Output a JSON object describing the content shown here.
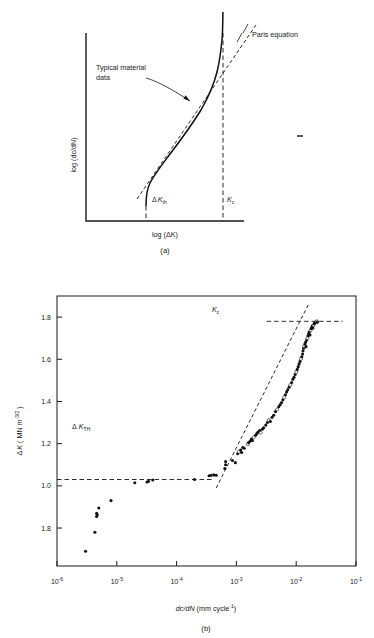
{
  "figure": {
    "panels": [
      {
        "id": "a",
        "caption": "(a)",
        "type": "schematic",
        "xlabel_parts": {
          "pre": "log (",
          "delta": "Δ",
          "k": "K",
          "post": ")"
        },
        "xlabel": "log (ΔK)",
        "ylabel": "log (dc/dN)",
        "annotations": [
          {
            "name": "paris-equation",
            "text": "Paris equation"
          },
          {
            "name": "typical-material-data",
            "line1": "Typical material",
            "line2": "data"
          },
          {
            "name": "delta-k-th",
            "delta": "Δ",
            "symbol": "K",
            "sub": "th"
          },
          {
            "name": "k-c",
            "symbol": "K",
            "sub": "c"
          }
        ]
      },
      {
        "id": "b",
        "caption": "(b)",
        "type": "scatter",
        "xlabel": "dc/dN  (mm cycle⁻¹)",
        "xlabel_parts": {
          "a": "d",
          "b": "c",
          "c": "/d",
          "d": "N",
          "e": "  (mm cycle",
          "sup": "-1",
          "f": ")"
        },
        "ylabel": "ΔK  (MN m⁻³ᐟ²)",
        "ylabel_parts": {
          "delta": "Δ",
          "k": "K",
          "open": "  ( MN m",
          "sup": "-3/2",
          "close": " )"
        },
        "annotations": [
          {
            "name": "delta-k-th-threshold",
            "delta": "Δ",
            "symbol": "K",
            "sub": "TH",
            "value": 1.03
          },
          {
            "name": "k-c-critical",
            "symbol": "K",
            "sub": "c",
            "value": 1.78
          }
        ]
      }
    ]
  },
  "chart_data": [
    {
      "panel": "a",
      "type": "line",
      "title": "",
      "xlabel": "log (ΔK)",
      "ylabel": "log (dc/dN)",
      "grid": false,
      "legend": null,
      "notes": "Schematic sigmoidal fatigue crack growth rate curve with three regimes; dashed asymptotes at threshold and fracture toughness, dashed Paris-law straight-line segment.",
      "series": [
        {
          "name": "Typical material data",
          "style": "solid-curve",
          "points_xy": [
            [
              0.3,
              0.05
            ],
            [
              0.303,
              0.11
            ],
            [
              0.312,
              0.17
            ],
            [
              0.33,
              0.228
            ],
            [
              0.36,
              0.285
            ],
            [
              0.4,
              0.34
            ],
            [
              0.45,
              0.4
            ],
            [
              0.51,
              0.47
            ],
            [
              0.57,
              0.545
            ],
            [
              0.625,
              0.62
            ],
            [
              0.672,
              0.7
            ],
            [
              0.71,
              0.775
            ],
            [
              0.74,
              0.84
            ],
            [
              0.762,
              0.9
            ],
            [
              0.776,
              0.948
            ],
            [
              0.784,
              0.985
            ],
            [
              0.788,
              1.0
            ]
          ]
        },
        {
          "name": "Paris equation",
          "style": "dashed-straight",
          "points_xy": [
            [
              0.215,
              -0.035
            ],
            [
              0.845,
              1.055
            ]
          ]
        }
      ],
      "asymptotes": [
        {
          "name": "delta-k-th",
          "orientation": "vertical",
          "x": 0.3,
          "label": "ΔK_th"
        },
        {
          "name": "k-c",
          "orientation": "vertical",
          "x": 0.79,
          "label": "K_c"
        }
      ]
    },
    {
      "panel": "b",
      "type": "scatter",
      "title": "",
      "xlabel": "dc/dN (mm cycle^-1)",
      "ylabel": "ΔK (MN m^-3/2)",
      "xscale": "log",
      "xlim": [
        1e-06,
        0.1
      ],
      "xticks": [
        1e-06,
        1e-05,
        0.0001,
        0.001,
        0.01,
        0.1
      ],
      "xticklabels": [
        "10⁻⁶",
        "10⁻⁵",
        "10⁻⁴",
        "10⁻³",
        "10⁻²",
        "10⁻¹"
      ],
      "xtick_exponents": [
        "-6",
        "-5",
        "-4",
        "-3",
        "-2",
        "-1"
      ],
      "yscale": "linear",
      "ylim": [
        0.62,
        1.9
      ],
      "yticks": [
        1.8,
        1.6,
        1.4,
        1.2,
        1.0,
        0.8
      ],
      "yticklabels": [
        "1.8",
        "1.6",
        "1.4",
        "1.2",
        "1.0",
        "1.8"
      ],
      "grid": false,
      "legend": null,
      "notes": "Experimental fatigue data: threshold plateau at ΔK_TH = 1.03 MN m^-3/2, steep rise toward K_c = 1.78 MN m^-3/2.",
      "reference_lines": [
        {
          "name": "delta-k-th-line",
          "orientation": "horizontal",
          "y": 1.03,
          "style": "dashed",
          "x_from": 1e-06,
          "x_to": 0.00042,
          "label": "ΔK_TH"
        },
        {
          "name": "k-c-line",
          "orientation": "horizontal",
          "y": 1.78,
          "style": "dashed",
          "x_from": 0.0032,
          "x_to": 0.06,
          "label": "K_c"
        },
        {
          "name": "paris-fit-line",
          "orientation": "oblique",
          "style": "dashed",
          "points_xy": [
            [
              0.00046,
              0.99
            ],
            [
              0.016,
              1.86
            ]
          ]
        }
      ],
      "points": [
        [
          3e-06,
          0.69
        ],
        [
          4.3e-06,
          0.78
        ],
        [
          4.6e-06,
          0.855
        ],
        [
          4.7e-06,
          0.862
        ],
        [
          4.6e-06,
          0.87
        ],
        [
          5e-06,
          0.895
        ],
        [
          8e-06,
          0.93
        ],
        [
          2e-05,
          1.015
        ],
        [
          3.2e-05,
          1.018
        ],
        [
          3.4e-05,
          1.022
        ],
        [
          4e-05,
          1.028
        ],
        [
          0.0002,
          1.03
        ],
        [
          0.00035,
          1.048
        ],
        [
          0.00038,
          1.05
        ],
        [
          0.00042,
          1.052
        ],
        [
          0.00046,
          1.05
        ],
        [
          0.00064,
          1.082
        ],
        [
          0.00066,
          1.1
        ],
        [
          0.00066,
          1.115
        ],
        [
          0.00086,
          1.12
        ],
        [
          0.00096,
          1.11
        ],
        [
          0.00105,
          1.152
        ],
        [
          0.0011,
          1.162
        ],
        [
          0.00118,
          1.17
        ],
        [
          0.00122,
          1.158
        ],
        [
          0.00128,
          1.182
        ],
        [
          0.00135,
          1.178
        ],
        [
          0.00155,
          1.198
        ],
        [
          0.0016,
          1.205
        ],
        [
          0.0017,
          1.212
        ],
        [
          0.00178,
          1.222
        ],
        [
          0.00185,
          1.215
        ],
        [
          0.00195,
          1.23
        ],
        [
          0.0021,
          1.24
        ],
        [
          0.0022,
          1.248
        ],
        [
          0.0023,
          1.255
        ],
        [
          0.00245,
          1.262
        ],
        [
          0.00255,
          1.252
        ],
        [
          0.0027,
          1.268
        ],
        [
          0.00285,
          1.275
        ],
        [
          0.0031,
          1.288
        ],
        [
          0.0033,
          1.3
        ],
        [
          0.0035,
          1.312
        ],
        [
          0.0037,
          1.305
        ],
        [
          0.00395,
          1.325
        ],
        [
          0.0042,
          1.335
        ],
        [
          0.0045,
          1.352
        ],
        [
          0.0048,
          1.362
        ],
        [
          0.0051,
          1.375
        ],
        [
          0.0054,
          1.385
        ],
        [
          0.0057,
          1.395
        ],
        [
          0.006,
          1.408
        ],
        [
          0.0063,
          1.42
        ],
        [
          0.0066,
          1.432
        ],
        [
          0.0069,
          1.445
        ],
        [
          0.0072,
          1.455
        ],
        [
          0.0076,
          1.468
        ],
        [
          0.008,
          1.478
        ],
        [
          0.0084,
          1.49
        ],
        [
          0.0088,
          1.505
        ],
        [
          0.0092,
          1.515
        ],
        [
          0.0096,
          1.528
        ],
        [
          0.01,
          1.54
        ],
        [
          0.0104,
          1.552
        ],
        [
          0.0108,
          1.565
        ],
        [
          0.0112,
          1.578
        ],
        [
          0.0116,
          1.59
        ],
        [
          0.012,
          1.602
        ],
        [
          0.0124,
          1.612
        ],
        [
          0.0128,
          1.625
        ],
        [
          0.013,
          1.64
        ],
        [
          0.0133,
          1.652
        ],
        [
          0.0136,
          1.662
        ],
        [
          0.014,
          1.672
        ],
        [
          0.0144,
          1.682
        ],
        [
          0.0146,
          1.66
        ],
        [
          0.015,
          1.692
        ],
        [
          0.0154,
          1.7
        ],
        [
          0.0158,
          1.712
        ],
        [
          0.0162,
          1.722
        ],
        [
          0.0166,
          1.73
        ],
        [
          0.017,
          1.715
        ],
        [
          0.0174,
          1.738
        ],
        [
          0.0178,
          1.745
        ],
        [
          0.0182,
          1.752
        ],
        [
          0.0186,
          1.758
        ],
        [
          0.019,
          1.748
        ],
        [
          0.0195,
          1.762
        ],
        [
          0.02,
          1.768
        ],
        [
          0.0205,
          1.772
        ],
        [
          0.021,
          1.775
        ],
        [
          0.0215,
          1.778
        ],
        [
          0.022,
          1.78
        ],
        [
          0.0225,
          1.776
        ]
      ]
    }
  ]
}
